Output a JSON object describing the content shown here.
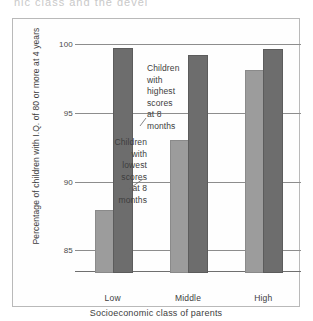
{
  "page": {
    "top_fragment": "nic class and the devel"
  },
  "chart_data": {
    "type": "bar",
    "title": "",
    "xlabel": "Socioeconomic class of parents",
    "ylabel": "Percentage of children with I.Q. of 80 or more at 4 years",
    "categories": [
      "Low",
      "Middle",
      "High"
    ],
    "ylim": [
      83.5,
      100.5
    ],
    "yticks": [
      85,
      90,
      95,
      100
    ],
    "ytick_labels": [
      "85",
      "90",
      "95",
      "100"
    ],
    "grid": "horizontal",
    "legend": "annotations",
    "series": [
      {
        "name": "Children with lowest scores at 8 months",
        "color": "#9c9c9c",
        "values": [
          87.9,
          93.0,
          98.1
        ]
      },
      {
        "name": "Children with highest scores at 8 months",
        "color": "#6d6d6d",
        "values": [
          99.7,
          99.2,
          99.6
        ]
      }
    ],
    "annotations": [
      {
        "id": "lowest",
        "text": "Children with lowest scores at 8 months",
        "lines": [
          "Children",
          "with",
          "lowest",
          "scores",
          "at 8",
          "months"
        ],
        "points_to": "low-light-bar"
      },
      {
        "id": "highest",
        "text": "Children with highest scores at 8 months",
        "lines": [
          "Children",
          "with",
          "highest",
          "scores",
          "at 8",
          "months"
        ],
        "points_to": "low-dark-bar"
      }
    ]
  }
}
